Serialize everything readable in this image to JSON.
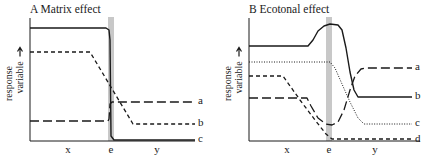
{
  "figure": {
    "background": "#ffffff",
    "ink": "#1a1a1a",
    "band_color": "#c8c8c8"
  },
  "chart_data": [
    {
      "type": "line",
      "id": "A",
      "title": "A  Matrix effect",
      "xlabel": "",
      "ylabel": "response variable",
      "x_ticks": [
        "x",
        "e",
        "y"
      ],
      "axes_px": {
        "x0": 30,
        "x1": 195,
        "y0": 141,
        "y1": 18
      },
      "band_px": {
        "x": 108,
        "w": 6
      },
      "tick_px": [
        68,
        111,
        157
      ],
      "series": [
        {
          "name": "a",
          "style": "longdash",
          "label_y": 104,
          "points": [
            [
              30,
              121
            ],
            [
              108,
              121
            ],
            [
              109,
              119
            ],
            [
              110,
              104
            ],
            [
              112,
              102
            ],
            [
              195,
              102
            ]
          ]
        },
        {
          "name": "b",
          "style": "shortdash",
          "label_y": 126,
          "points": [
            [
              30,
              52
            ],
            [
              90,
              52
            ],
            [
              133,
              124
            ],
            [
              195,
              124
            ]
          ]
        },
        {
          "name": "c",
          "style": "solid",
          "label_y": 142,
          "points": [
            [
              30,
              28
            ],
            [
              106,
              28
            ],
            [
              109,
              30
            ],
            [
              110,
              40
            ],
            [
              111,
              136
            ],
            [
              114,
              140
            ],
            [
              195,
              140
            ]
          ]
        }
      ]
    },
    {
      "type": "line",
      "id": "B",
      "title": "B  Ecotonal effect",
      "xlabel": "",
      "ylabel": "response variable",
      "x_ticks": [
        "x",
        "e",
        "y"
      ],
      "axes_px": {
        "x0": 249,
        "x1": 420,
        "y0": 141,
        "y1": 18
      },
      "band_px": {
        "x": 326,
        "w": 6
      },
      "tick_px": [
        287,
        329,
        375
      ],
      "series": [
        {
          "name": "a",
          "style": "longdash",
          "label_y": 70,
          "points": [
            [
              249,
              98
            ],
            [
              307,
              98
            ],
            [
              311,
              106
            ],
            [
              318,
              118
            ],
            [
              326,
              124
            ],
            [
              332,
              125
            ],
            [
              338,
              122
            ],
            [
              344,
              110
            ],
            [
              350,
              90
            ],
            [
              355,
              76
            ],
            [
              361,
              69
            ],
            [
              366,
              68
            ],
            [
              412,
              68
            ]
          ]
        },
        {
          "name": "b",
          "style": "solid",
          "label_y": 99,
          "points": [
            [
              249,
              46
            ],
            [
              308,
              46
            ],
            [
              313,
              40
            ],
            [
              318,
              31
            ],
            [
              324,
              26
            ],
            [
              330,
              24
            ],
            [
              338,
              25
            ],
            [
              342,
              30
            ],
            [
              346,
              48
            ],
            [
              350,
              72
            ],
            [
              354,
              90
            ],
            [
              358,
              97
            ],
            [
              412,
              97
            ]
          ]
        },
        {
          "name": "c",
          "style": "dotted",
          "label_y": 126,
          "points": [
            [
              249,
              62
            ],
            [
              330,
              62
            ],
            [
              335,
              68
            ],
            [
              342,
              84
            ],
            [
              350,
              102
            ],
            [
              358,
              118
            ],
            [
              364,
              124
            ],
            [
              412,
              124
            ]
          ]
        },
        {
          "name": "d",
          "style": "shortdash",
          "label_y": 142,
          "points": [
            [
              249,
              76
            ],
            [
              283,
              76
            ],
            [
              300,
              100
            ],
            [
              315,
              120
            ],
            [
              326,
              134
            ],
            [
              332,
              139
            ],
            [
              412,
              139
            ]
          ]
        }
      ]
    }
  ]
}
